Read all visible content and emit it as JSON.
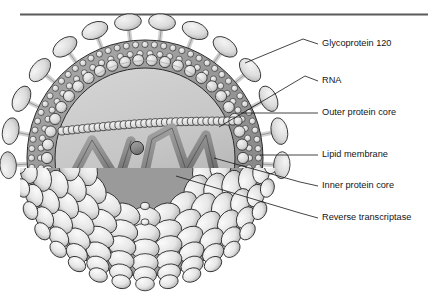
{
  "figure": {
    "kind": "hiv-virion-cutaway-diagram",
    "title_rule": "horizontal-divider-top",
    "background_color": "#ffffff",
    "line_color": "#151515"
  },
  "palette": {
    "envelope_fill": "#9a9a9a",
    "envelope_dark": "#808080",
    "bead_light": "#e3e3e3",
    "bead_mid": "#c4c4c4",
    "core_fill": "#c9c9c9",
    "core_fill_dark": "#b3b3b3",
    "rna_fill": "#8f8f8f",
    "capsomer_fill": "#e8e8e8",
    "capsomer_shadow": "#9c9c9c",
    "spike_fill": "#dcdcdc",
    "outline": "#2b2b2b",
    "rule_color": "#5a5a5a"
  },
  "labels": [
    {
      "id": "glycoprotein-120",
      "text": "Glycoprotein 120",
      "x": 322,
      "y": 44,
      "leader": [
        [
          318,
          44
        ],
        [
          303,
          39
        ],
        [
          245,
          63
        ]
      ]
    },
    {
      "id": "rna",
      "text": "RNA",
      "x": 322,
      "y": 81,
      "leader": [
        [
          318,
          81
        ],
        [
          305,
          76
        ],
        [
          219,
          127
        ]
      ]
    },
    {
      "id": "outer-protein-core",
      "text": "Outer protein core",
      "x": 322,
      "y": 113,
      "leader": [
        [
          318,
          113
        ],
        [
          241,
          113
        ]
      ]
    },
    {
      "id": "lipid-membrane",
      "text": "Lipid membrane",
      "x": 322,
      "y": 155,
      "leader": [
        [
          318,
          155
        ],
        [
          260,
          155
        ]
      ]
    },
    {
      "id": "inner-protein-core",
      "text": "Inner protein core",
      "x": 322,
      "y": 186,
      "leader": [
        [
          318,
          186
        ],
        [
          300,
          182
        ],
        [
          214,
          158
        ]
      ]
    },
    {
      "id": "reverse-transcriptase",
      "text": "Reverse transcriptase",
      "x": 322,
      "y": 218,
      "leader": [
        [
          318,
          218
        ],
        [
          300,
          213
        ],
        [
          176,
          176
        ]
      ]
    }
  ],
  "structure": {
    "center": {
      "x": 145,
      "y": 158
    },
    "envelope_radius": 128,
    "bead_ring_outer_radius": 118,
    "bead_ring_inner_radius": 104,
    "core_radius": 90,
    "spike_count": 14,
    "capsomer_rows": 7
  }
}
